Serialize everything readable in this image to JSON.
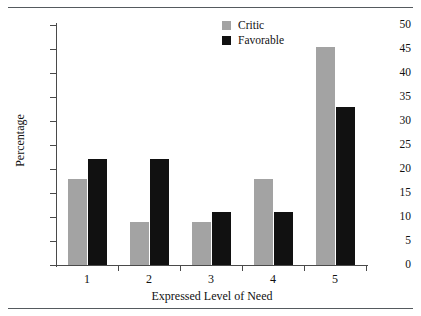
{
  "chart_data": {
    "type": "bar",
    "title": "",
    "xlabel": "Expressed Level of Need",
    "ylabel": "Percentage",
    "categories": [
      "1",
      "2",
      "3",
      "4",
      "5"
    ],
    "series": [
      {
        "name": "Critic",
        "color": "#a3a3a3",
        "values": [
          18,
          9,
          9,
          18,
          45.5
        ]
      },
      {
        "name": "Favorable",
        "color": "#111111",
        "values": [
          22,
          22,
          11,
          11,
          33
        ]
      }
    ],
    "ylim": [
      0,
      50
    ],
    "yticks": [
      0,
      5,
      10,
      15,
      20,
      25,
      30,
      35,
      40,
      45,
      50
    ],
    "ytick_labels": [
      "0",
      "5",
      "10",
      "15",
      "20",
      "25",
      "30",
      "35",
      "40",
      "45",
      "50"
    ],
    "grid": false,
    "legend_position": "top-right"
  },
  "legend": {
    "entries": [
      {
        "label": "Critic"
      },
      {
        "label": "Favorable"
      }
    ]
  },
  "rules": {
    "top": "horizontal-rule",
    "bottom": "horizontal-rule"
  }
}
